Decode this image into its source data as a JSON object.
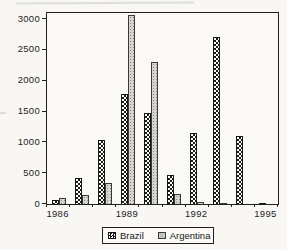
{
  "chart_data": {
    "type": "bar",
    "title": "",
    "xlabel": "",
    "ylabel": "",
    "categories": [
      "1986",
      "1987",
      "1988",
      "1989",
      "1990",
      "1991",
      "1992",
      "1993",
      "1994",
      "1995"
    ],
    "series": [
      {
        "name": "Brazil",
        "values": [
          60,
          420,
          1040,
          1780,
          1480,
          470,
          1160,
          2710,
          1100,
          20
        ]
      },
      {
        "name": "Argentina",
        "values": [
          100,
          150,
          340,
          3060,
          2300,
          170,
          30,
          15,
          0,
          0
        ]
      }
    ],
    "y_ticks": [
      0,
      500,
      1000,
      1500,
      2000,
      2500,
      3000
    ],
    "x_tick_labels": [
      "1986",
      "1989",
      "1992",
      "1995"
    ],
    "x_label_group_indexes": [
      0,
      3,
      6,
      9
    ],
    "ylim": [
      0,
      3100
    ],
    "grid": false,
    "legend_position": "bottom"
  },
  "legend": {
    "items": [
      {
        "label": "Brazil",
        "swatch": "dark-checker-pattern"
      },
      {
        "label": "Argentina",
        "swatch": "light-dot-pattern"
      }
    ]
  },
  "colors": {
    "background": "#f8f7f4",
    "frame": "#222120",
    "brazil_pattern": "#1c1c1c",
    "argentina_fill": "#d5d4cf",
    "argentina_dot": "#8b8a84",
    "text": "#1f1e1c"
  }
}
